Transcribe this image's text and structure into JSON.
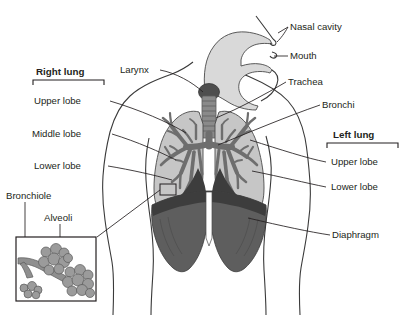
{
  "diagram": {
    "type": "anatomical-illustration",
    "background_color": "#ffffff"
  },
  "colors": {
    "text": "#231f20",
    "leader_line": "#231f20",
    "body_outline": "#3a3a3a",
    "lung_fill": "#c6c6c6",
    "bronchi_fill": "#6e6e6e",
    "trachea_fill": "#8a8a8a",
    "larynx_fill": "#4e4e4e",
    "diaphragm_fill": "#5e5e5e",
    "diaphragm_dark": "#3d3d3d",
    "airway_head_fill": "#d9d9d9",
    "alveoli_fill": "#9b9b9b",
    "bronchiole_fill": "#8f8f8f",
    "inset_border": "#231f20"
  },
  "labels": {
    "nasal_cavity": "Nasal cavity",
    "mouth": "Mouth",
    "trachea": "Trachea",
    "bronchi": "Bronchi",
    "larynx": "Larynx",
    "diaphragm": "Diaphragm",
    "bronchiole": "Bronchiole",
    "alveoli": "Alveoli"
  },
  "right_lung": {
    "heading": "Right lung",
    "lobes": [
      "Upper lobe",
      "Middle lobe",
      "Lower lobe"
    ]
  },
  "left_lung": {
    "heading": "Left lung",
    "lobes": [
      "Upper lobe",
      "Lower lobe"
    ]
  },
  "inset": {
    "name": "alveoli-magnification",
    "labels": [
      "Bronchiole",
      "Alveoli"
    ]
  }
}
